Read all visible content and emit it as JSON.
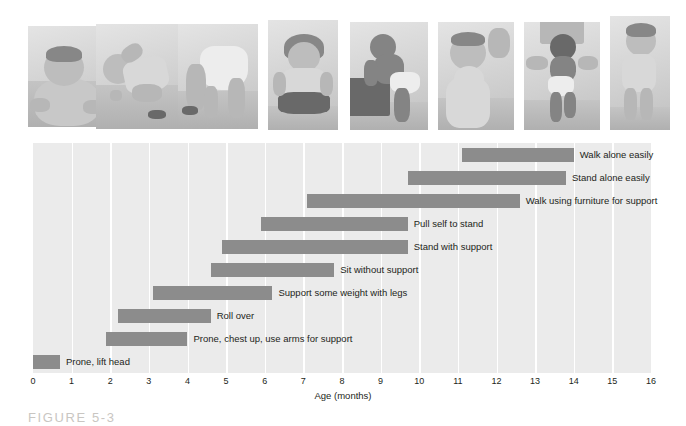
{
  "figure": {
    "caption": "FIGURE 5-3"
  },
  "photos": [
    {
      "name": "infant-prone-lift-head",
      "alt": "Infant lying prone lifting head"
    },
    {
      "name": "infant-rolling-over",
      "alt": "Infant rolling over"
    },
    {
      "name": "infant-crawling",
      "alt": "Infant on hands and knees crawling"
    },
    {
      "name": "infant-sitting-unsupported",
      "alt": "Infant sitting without support"
    },
    {
      "name": "infant-pulling-to-stand",
      "alt": "Infant pulling self up to stand at a step"
    },
    {
      "name": "infant-standing-support",
      "alt": "Infant standing holding on for support"
    },
    {
      "name": "infant-walking-assisted",
      "alt": "Infant walking while held by adult hands"
    },
    {
      "name": "toddler-walking-alone",
      "alt": "Toddler walking alone"
    }
  ],
  "chart_data": {
    "type": "bar",
    "orientation": "horizontal",
    "subtype": "range-bar",
    "title": "",
    "xlabel": "Age (months)",
    "ylabel": "Degree of motor development",
    "xlim": [
      0,
      16
    ],
    "xticks": [
      0,
      1,
      2,
      3,
      4,
      5,
      6,
      7,
      8,
      9,
      10,
      11,
      12,
      13,
      14,
      15,
      16
    ],
    "xtick_labels": [
      "0",
      "1",
      "2",
      "3",
      "4",
      "5",
      "6",
      "7",
      "8",
      "9",
      "10",
      "11",
      "12",
      "13",
      "14",
      "15",
      "16"
    ],
    "grid": "vertical-white",
    "legend": "none",
    "bar_color": "#8c8c8c",
    "plot_background": "#ebebeb",
    "categories": [
      "Walk alone easily",
      "Stand alone easily",
      "Walk using furniture for support",
      "Pull self to stand",
      "Stand with support",
      "Sit without support",
      "Support some weight with legs",
      "Roll over",
      "Prone, chest up, use arms for support",
      "Prone, lift head"
    ],
    "bars": [
      {
        "label": "Walk alone easily",
        "start": 11.1,
        "end": 14.0
      },
      {
        "label": "Stand alone easily",
        "start": 9.7,
        "end": 13.8
      },
      {
        "label": "Walk using furniture for support",
        "start": 7.1,
        "end": 12.6
      },
      {
        "label": "Pull self to stand",
        "start": 5.9,
        "end": 9.7
      },
      {
        "label": "Stand with support",
        "start": 4.9,
        "end": 9.7
      },
      {
        "label": "Sit without support",
        "start": 4.6,
        "end": 7.8
      },
      {
        "label": "Support some weight with legs",
        "start": 3.1,
        "end": 6.2
      },
      {
        "label": "Roll over",
        "start": 2.2,
        "end": 4.6
      },
      {
        "label": "Prone, chest up, use arms for support",
        "start": 1.9,
        "end": 4.0
      },
      {
        "label": "Prone, lift head",
        "start": 0.0,
        "end": 0.7
      }
    ]
  }
}
